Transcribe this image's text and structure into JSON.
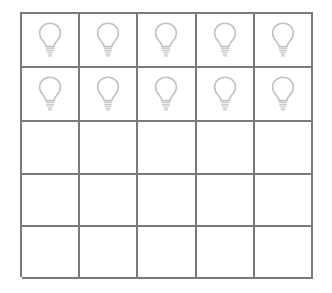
{
  "page": {
    "background_color": "#ffffff"
  },
  "grid": {
    "name": "bulb-grid",
    "rows": 5,
    "columns": 5,
    "total_cells": 25,
    "filled_cells": 10,
    "empty_cells": 15,
    "border_color": "#7a7a7a",
    "border_width_px": 2,
    "cell_fill_color": "#ffffff",
    "icon": {
      "name": "light-bulb-icon",
      "label": "light bulb",
      "stroke_color": "#c2c2c2",
      "fill": "none"
    },
    "cells": [
      {
        "row": 1,
        "col": 1,
        "content": "light-bulb-icon"
      },
      {
        "row": 1,
        "col": 2,
        "content": "light-bulb-icon"
      },
      {
        "row": 1,
        "col": 3,
        "content": "light-bulb-icon"
      },
      {
        "row": 1,
        "col": 4,
        "content": "light-bulb-icon"
      },
      {
        "row": 1,
        "col": 5,
        "content": "light-bulb-icon"
      },
      {
        "row": 2,
        "col": 1,
        "content": "light-bulb-icon"
      },
      {
        "row": 2,
        "col": 2,
        "content": "light-bulb-icon"
      },
      {
        "row": 2,
        "col": 3,
        "content": "light-bulb-icon"
      },
      {
        "row": 2,
        "col": 4,
        "content": "light-bulb-icon"
      },
      {
        "row": 2,
        "col": 5,
        "content": "light-bulb-icon"
      },
      {
        "row": 3,
        "col": 1,
        "content": ""
      },
      {
        "row": 3,
        "col": 2,
        "content": ""
      },
      {
        "row": 3,
        "col": 3,
        "content": ""
      },
      {
        "row": 3,
        "col": 4,
        "content": ""
      },
      {
        "row": 3,
        "col": 5,
        "content": ""
      },
      {
        "row": 4,
        "col": 1,
        "content": ""
      },
      {
        "row": 4,
        "col": 2,
        "content": ""
      },
      {
        "row": 4,
        "col": 3,
        "content": ""
      },
      {
        "row": 4,
        "col": 4,
        "content": ""
      },
      {
        "row": 4,
        "col": 5,
        "content": ""
      },
      {
        "row": 5,
        "col": 1,
        "content": ""
      },
      {
        "row": 5,
        "col": 2,
        "content": ""
      },
      {
        "row": 5,
        "col": 3,
        "content": ""
      },
      {
        "row": 5,
        "col": 4,
        "content": ""
      },
      {
        "row": 5,
        "col": 5,
        "content": ""
      }
    ]
  }
}
